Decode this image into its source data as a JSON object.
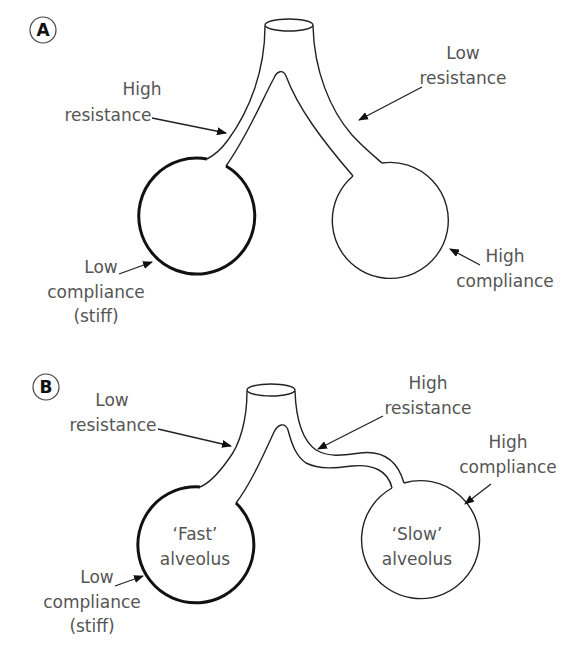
{
  "panels": [
    {
      "badge": "A",
      "labels": {
        "left_airway": [
          "High",
          "resistance"
        ],
        "right_airway": [
          "Low",
          "resistance"
        ],
        "left_alveolus": [
          "Low",
          "compliance",
          "(stiff)"
        ],
        "right_alveolus": [
          "High",
          "compliance"
        ]
      },
      "alveoli": {
        "left": {
          "name": "",
          "compliance": "low",
          "stroke": "thick"
        },
        "right": {
          "name": "",
          "compliance": "high",
          "stroke": "thin"
        }
      }
    },
    {
      "badge": "B",
      "labels": {
        "left_airway": [
          "Low",
          "resistance"
        ],
        "right_airway": [
          "High",
          "resistance"
        ],
        "left_alveolus": [
          "Low",
          "compliance",
          "(stiff)"
        ],
        "right_alveolus": [
          "High",
          "compliance"
        ]
      },
      "alveoli": {
        "left": {
          "name": [
            "‘Fast’",
            "alveolus"
          ],
          "compliance": "low",
          "stroke": "thick"
        },
        "right": {
          "name": [
            "‘Slow’",
            "alveolus"
          ],
          "compliance": "high",
          "stroke": "thin"
        }
      }
    }
  ],
  "colors": {
    "line": "#222222",
    "label_text": "#555555",
    "background": "#ffffff"
  }
}
